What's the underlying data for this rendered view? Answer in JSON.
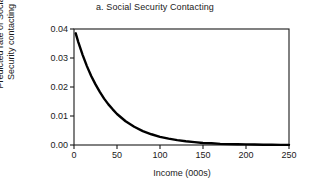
{
  "chart_data": {
    "type": "line",
    "title": "a. Social Security Contacting",
    "xlabel": "Income (000s)",
    "ylabel_lines": [
      "Predicted rate of Social",
      "Security contacting"
    ],
    "ylabel": "Predicted rate of Social Security contacting",
    "xlim": [
      0,
      250
    ],
    "ylim": [
      0.0,
      0.04
    ],
    "xticks": [
      0,
      50,
      100,
      150,
      200,
      250
    ],
    "xtick_labels": [
      "0",
      "50",
      "100",
      "150",
      "200",
      "250"
    ],
    "yticks": [
      0.0,
      0.01,
      0.02,
      0.03,
      0.04
    ],
    "ytick_labels": [
      "0.00",
      "0.01",
      "0.02",
      "0.03",
      "0.04"
    ],
    "grid": false,
    "legend": false,
    "legend_position": "none",
    "line_color": "#000000",
    "line_width": 2.4,
    "axis_color": "#1a1a1a",
    "background": "#ffffff",
    "series": [
      {
        "name": "Predicted rate of Social Security contacting",
        "x": [
          2,
          5,
          10,
          15,
          20,
          25,
          30,
          35,
          40,
          45,
          50,
          60,
          70,
          80,
          90,
          100,
          110,
          120,
          130,
          140,
          150,
          160,
          170,
          180,
          190,
          200,
          210,
          220,
          230,
          240,
          250
        ],
        "y": [
          0.0385,
          0.0355,
          0.0311,
          0.0272,
          0.0238,
          0.0209,
          0.0183,
          0.016,
          0.014,
          0.0123,
          0.0107,
          0.0082,
          0.0063,
          0.0048,
          0.0037,
          0.0028,
          0.0022,
          0.0017,
          0.0013,
          0.001,
          0.0007,
          0.0006,
          0.0004,
          0.0003,
          0.00025,
          0.0002,
          0.00015,
          0.0001,
          0.0001,
          5e-05,
          5e-05
        ]
      }
    ]
  }
}
